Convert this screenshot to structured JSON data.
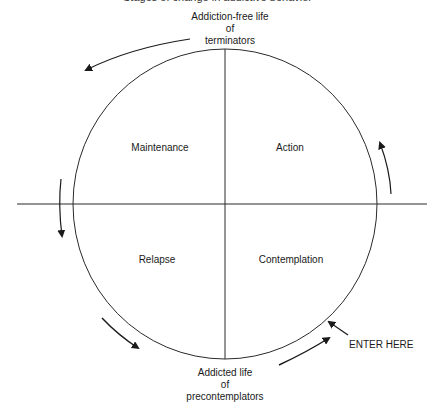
{
  "diagram": {
    "title_partial": "Stages of change in addictive behavior",
    "top_label": [
      "Addiction-free life",
      "of",
      "terminators"
    ],
    "bottom_label": [
      "Addicted life",
      "of",
      "precontemplators"
    ],
    "quadrants": {
      "top_left": "Maintenance",
      "top_right": "Action",
      "bottom_left": "Relapse",
      "bottom_right": "Contemplation"
    },
    "entry_label": "ENTER HERE",
    "colors": {
      "line": "#2a2a2a",
      "background": "#ffffff"
    }
  }
}
